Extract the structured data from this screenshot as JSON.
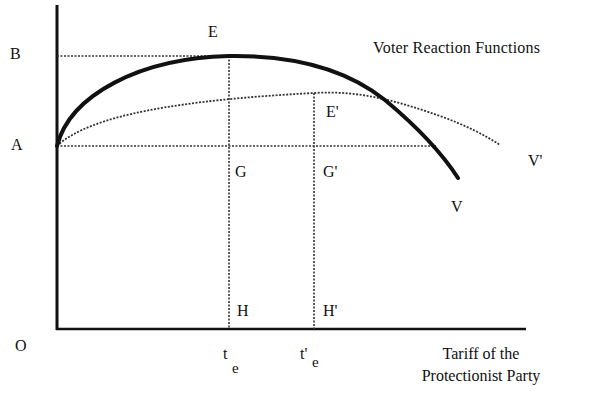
{
  "diagram": {
    "title": "Voter Reaction Functions",
    "x_axis_label_line1": "Tariff of the",
    "x_axis_label_line2": "Protectionist Party",
    "origin_label": "O",
    "y_labels": {
      "B": "B",
      "A": "A"
    },
    "points": {
      "E": "E",
      "E_prime": "E'",
      "G": "G",
      "G_prime": "G'",
      "H": "H",
      "H_prime": "H'"
    },
    "x_ticks": {
      "te_main": "t",
      "te_sub": "e",
      "te_prime_main": "t'",
      "te_prime_sub": "e"
    },
    "curves": {
      "V": {
        "label": "V",
        "style": "solid-thick"
      },
      "V_prime": {
        "label": "V'",
        "style": "dotted"
      }
    },
    "colors": {
      "ink": "#111111",
      "background": "#ffffff"
    }
  }
}
